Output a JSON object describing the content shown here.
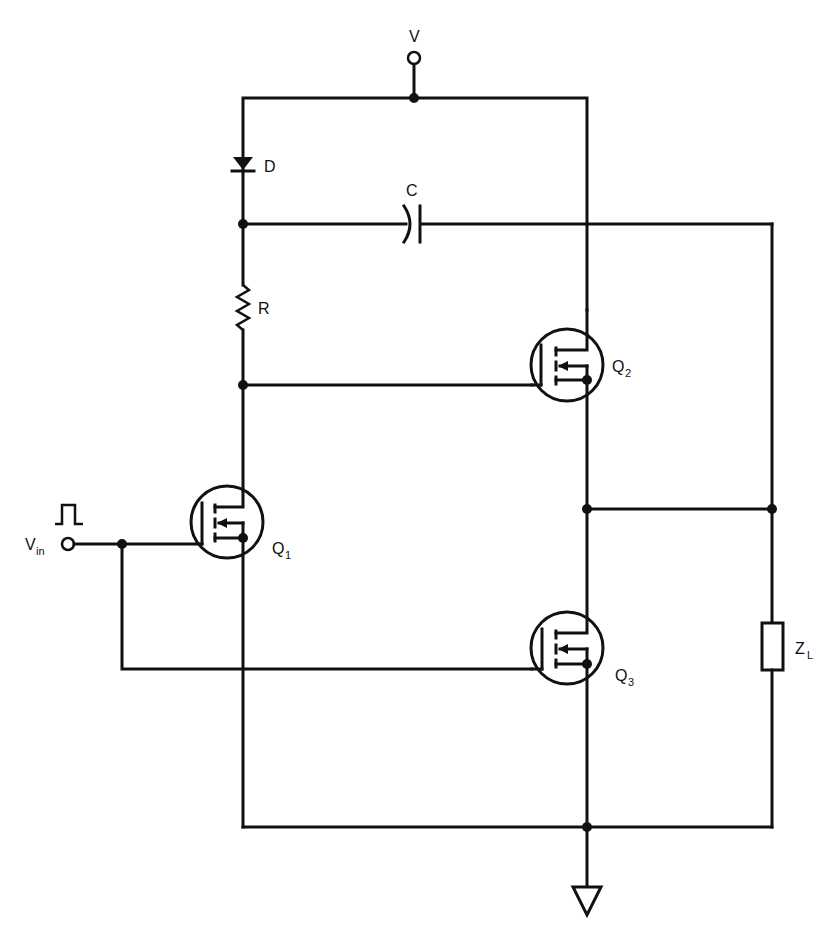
{
  "diagram": {
    "type": "schematic",
    "colors": {
      "ink": "#111111",
      "background": "#ffffff"
    }
  },
  "labels": {
    "supply": "V",
    "diode": "D",
    "capacitor": "C",
    "resistor": "R",
    "q1": {
      "main": "Q",
      "sub": "1"
    },
    "q2": {
      "main": "Q",
      "sub": "2"
    },
    "q3": {
      "main": "Q",
      "sub": "3"
    },
    "load": {
      "main": "Z",
      "sub": "L"
    },
    "input": {
      "main": "V",
      "sub": "in"
    }
  },
  "components": [
    {
      "id": "V",
      "kind": "supply-terminal"
    },
    {
      "id": "D",
      "kind": "diode"
    },
    {
      "id": "C",
      "kind": "capacitor"
    },
    {
      "id": "R",
      "kind": "resistor"
    },
    {
      "id": "Q1",
      "kind": "n-mosfet"
    },
    {
      "id": "Q2",
      "kind": "n-mosfet"
    },
    {
      "id": "Q3",
      "kind": "n-mosfet"
    },
    {
      "id": "ZL",
      "kind": "load-impedance"
    },
    {
      "id": "Vin",
      "kind": "input-terminal",
      "signal": "pulse"
    },
    {
      "id": "GND",
      "kind": "ground"
    }
  ]
}
